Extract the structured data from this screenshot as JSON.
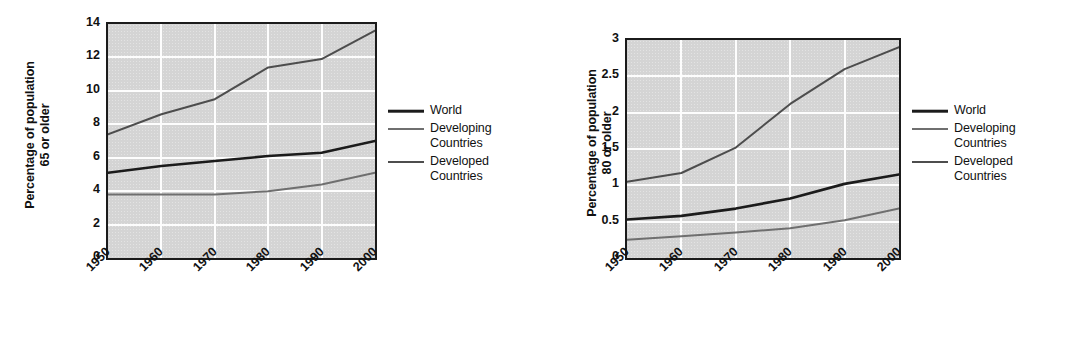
{
  "figure": {
    "background": "#ffffff",
    "plot_background": "#d4d4d4",
    "grid_color": "#fdfdfd",
    "frame_color": "#1b1b1b"
  },
  "legend": {
    "entries": [
      {
        "label": "World",
        "key": "world",
        "color": "#1b1b1b",
        "width": 2.6
      },
      {
        "label": "Developing\nCountries",
        "key": "developing",
        "color": "#6f6f6f",
        "width": 2.0
      },
      {
        "label": "Developed\nCountries",
        "key": "developed",
        "color": "#4d4d4d",
        "width": 2.0
      }
    ]
  },
  "chart_data": [
    {
      "id": "chart-65-or-older",
      "type": "line",
      "title": "",
      "xlabel": "",
      "ylabel": "Percentage of population\n65 or older",
      "ylabel_line1": "Percentage of population",
      "ylabel_line2": "65 or older",
      "x": [
        1950,
        1960,
        1970,
        1980,
        1990,
        2000
      ],
      "categories": [
        "1950",
        "1960",
        "1970",
        "1980",
        "1990",
        "2000"
      ],
      "xtick_labels": [
        "1950",
        "1960",
        "1970",
        "1980",
        "1990",
        "2000"
      ],
      "ytick_labels": [
        "0",
        "2",
        "4",
        "6",
        "8",
        "10",
        "12",
        "14"
      ],
      "yticks": [
        0,
        2,
        4,
        6,
        8,
        10,
        12,
        14
      ],
      "ylim": [
        0,
        14
      ],
      "xlim": [
        1950,
        2000
      ],
      "grid": true,
      "legend_position": "right",
      "series": [
        {
          "name": "World",
          "key": "world",
          "color": "#1b1b1b",
          "width": 2.6,
          "values": [
            5.1,
            5.5,
            5.8,
            6.1,
            6.3,
            7.0
          ]
        },
        {
          "name": "Developing Countries",
          "key": "developing",
          "color": "#6f6f6f",
          "width": 2.0,
          "values": [
            3.8,
            3.8,
            3.8,
            4.0,
            4.4,
            5.1
          ]
        },
        {
          "name": "Developed Countries",
          "key": "developed",
          "color": "#4d4d4d",
          "width": 2.0,
          "values": [
            7.4,
            8.6,
            9.5,
            11.4,
            11.9,
            13.6
          ]
        }
      ]
    },
    {
      "id": "chart-80-or-older",
      "type": "line",
      "title": "",
      "xlabel": "",
      "ylabel": "Percentage of population\n80 or older",
      "ylabel_line1": "Percentage of population",
      "ylabel_line2": "80 or older",
      "x": [
        1950,
        1960,
        1970,
        1980,
        1990,
        2000
      ],
      "categories": [
        "1950",
        "1960",
        "1970",
        "1980",
        "1990",
        "2000"
      ],
      "xtick_labels": [
        "1950",
        "1960",
        "1970",
        "1980",
        "1990",
        "2000"
      ],
      "ytick_labels": [
        "0",
        "0.5",
        "1",
        "1.5",
        "2",
        "2.5",
        "3"
      ],
      "yticks": [
        0,
        0.5,
        1,
        1.5,
        2,
        2.5,
        3
      ],
      "ylim": [
        0,
        3
      ],
      "xlim": [
        1950,
        2000
      ],
      "grid": true,
      "legend_position": "right",
      "series": [
        {
          "name": "World",
          "key": "world",
          "color": "#1b1b1b",
          "width": 2.6,
          "values": [
            0.53,
            0.58,
            0.68,
            0.82,
            1.02,
            1.15
          ]
        },
        {
          "name": "Developing Countries",
          "key": "developing",
          "color": "#6f6f6f",
          "width": 2.0,
          "values": [
            0.25,
            0.3,
            0.35,
            0.41,
            0.52,
            0.68
          ]
        },
        {
          "name": "Developed Countries",
          "key": "developed",
          "color": "#4d4d4d",
          "width": 2.0,
          "values": [
            1.05,
            1.17,
            1.52,
            2.12,
            2.6,
            2.9
          ]
        }
      ]
    }
  ]
}
